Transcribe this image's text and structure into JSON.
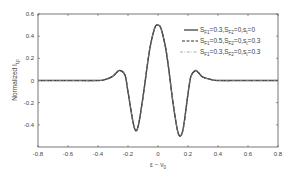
{
  "chart_data": {
    "type": "line",
    "title": "",
    "xlabel": "ε − ν0",
    "ylabel": "Normalized I_t,p",
    "xlim": [
      -0.8,
      0.8
    ],
    "ylim": [
      -0.6,
      0.6
    ],
    "xticks": [
      "-0.8",
      "-0.6",
      "-0.4",
      "-0.2",
      "0",
      "0.2",
      "0.4",
      "0.6",
      "0.8"
    ],
    "yticks": [
      "0.6",
      "0.4",
      "0.2",
      "0",
      "-0.2",
      "-0.4"
    ],
    "grid": false,
    "legend_position": "upper right",
    "x": [
      -0.8,
      -0.6,
      -0.4,
      -0.35,
      -0.3,
      -0.27,
      -0.25,
      -0.22,
      -0.2,
      -0.17,
      -0.15,
      -0.13,
      -0.1,
      -0.07,
      -0.05,
      -0.02,
      0,
      0.02,
      0.05,
      0.07,
      0.1,
      0.13,
      0.15,
      0.17,
      0.2,
      0.22,
      0.25,
      0.27,
      0.3,
      0.35,
      0.4,
      0.6,
      0.8
    ],
    "series": [
      {
        "name": "S_F1=0.3,S_F2=0,s_t=0",
        "style": "solid",
        "values": [
          0,
          0,
          0,
          0.01,
          0.04,
          0.08,
          0.09,
          0.05,
          -0.1,
          -0.35,
          -0.45,
          -0.4,
          -0.15,
          0.15,
          0.32,
          0.48,
          0.5,
          0.47,
          0.3,
          0.12,
          -0.2,
          -0.45,
          -0.5,
          -0.42,
          -0.12,
          0.04,
          0.09,
          0.07,
          0.03,
          0.01,
          0,
          0,
          0
        ]
      },
      {
        "name": "S_F1=0.5,S_F2=0,s_t=0.3",
        "style": "dashed",
        "values": [
          0,
          0,
          0,
          0.01,
          0.04,
          0.08,
          0.09,
          0.05,
          -0.1,
          -0.35,
          -0.45,
          -0.4,
          -0.15,
          0.15,
          0.32,
          0.48,
          0.5,
          0.47,
          0.3,
          0.12,
          -0.2,
          -0.45,
          -0.5,
          -0.42,
          -0.12,
          0.04,
          0.09,
          0.07,
          0.03,
          0.01,
          0,
          0,
          0
        ]
      },
      {
        "name": "S_F1=0.3,S_F2=0,s_t=0.3",
        "style": "dash-dot",
        "values": [
          0,
          0,
          0,
          0.01,
          0.04,
          0.08,
          0.09,
          0.05,
          -0.1,
          -0.35,
          -0.45,
          -0.4,
          -0.15,
          0.15,
          0.32,
          0.48,
          0.5,
          0.47,
          0.3,
          0.12,
          -0.2,
          -0.45,
          -0.5,
          -0.42,
          -0.12,
          0.04,
          0.09,
          0.07,
          0.03,
          0.01,
          0,
          0,
          0
        ]
      }
    ]
  },
  "legend": [
    {
      "main": "S",
      "sub1": "F1",
      "t1": "=0.3,S",
      "sub2": "F2",
      "t2": "=0,s",
      "sub3": "t",
      "t3": "=0"
    },
    {
      "main": "S",
      "sub1": "F1",
      "t1": "=0.5,S",
      "sub2": "F2",
      "t2": "=0,s",
      "sub3": "t",
      "t3": "=0.3"
    },
    {
      "main": "S",
      "sub1": "F1",
      "t1": "=0.3,S",
      "sub2": "F2",
      "t2": "=0,s",
      "sub3": "t",
      "t3": "=0.3"
    }
  ],
  "axes": {
    "ylabel_main": "Normalized I",
    "ylabel_sub": "t,p",
    "xlabel_main": "ε − ν",
    "xlabel_sub": "0"
  }
}
